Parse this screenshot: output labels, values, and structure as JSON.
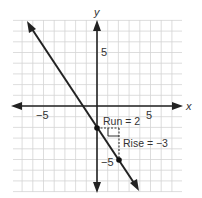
{
  "chart_data": {
    "type": "line",
    "title": "",
    "xlabel": "x",
    "ylabel": "y",
    "xlim": [
      -8,
      8
    ],
    "ylim": [
      -8,
      8
    ],
    "grid": true,
    "x_ticks": [
      {
        "value": -5,
        "label": "−5"
      },
      {
        "value": 5,
        "label": "5"
      }
    ],
    "y_ticks": [
      {
        "value": 5,
        "label": "5"
      },
      {
        "value": -5,
        "label": "−5"
      }
    ],
    "series": [
      {
        "name": "line",
        "equation": "y = -1.5x - 2",
        "slope": -1.5,
        "intercept": -2,
        "x": [
          -5.5,
          3.9
        ],
        "y": [
          6.25,
          -7.85
        ]
      }
    ],
    "points": [
      {
        "x": 0,
        "y": -2
      },
      {
        "x": 2,
        "y": -5
      }
    ],
    "annotations": [
      {
        "text": "Run = 2",
        "x": 0.3,
        "y": -1.6
      },
      {
        "text": "Rise = −3",
        "x": 2.3,
        "y": -3.6
      }
    ]
  },
  "labels": {
    "x_axis": "x",
    "y_axis": "y",
    "x_neg5": "−5",
    "x_pos5": "5",
    "y_pos5": "5",
    "y_neg5": "−5",
    "run": "Run = 2",
    "rise": "Rise = −3"
  }
}
